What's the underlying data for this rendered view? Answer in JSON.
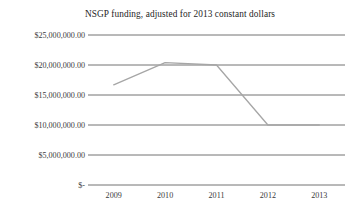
{
  "chart_data": {
    "type": "line",
    "title": "NSGP funding, adjusted for 2013 constant dollars",
    "xlabel": "",
    "ylabel": "",
    "categories": [
      "2009",
      "2010",
      "2011",
      "2012",
      "2013"
    ],
    "values": [
      16700000,
      20400000,
      20000000,
      10000000,
      10000000
    ],
    "series": [
      {
        "name": "NSGP funding",
        "values": [
          16700000,
          20400000,
          20000000,
          10000000,
          10000000
        ]
      }
    ],
    "ylim": [
      0,
      25000000
    ],
    "ytick_values": [
      0,
      5000000,
      10000000,
      15000000,
      20000000,
      25000000
    ],
    "ytick_labels": [
      "$-",
      "$5,000,000.00",
      "$10,000,000.00",
      "$15,000,000.00",
      "$20,000,000.00",
      "$25,000,000.00"
    ],
    "xtick_labels": [
      "2009",
      "2010",
      "2011",
      "2012",
      "2013"
    ],
    "grid": true,
    "grid_axis": "y",
    "legend": false,
    "legend_position": "none",
    "line_color": "#a6a6a6",
    "grid_color": "#4f4f4f",
    "text_color": "#3a3a3a",
    "background_color": "#ffffff"
  }
}
